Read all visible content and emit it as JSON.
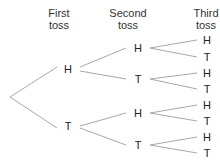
{
  "headers": [
    {
      "line1": "First",
      "line2": "toss",
      "cx": 59
    },
    {
      "line1": "Second",
      "line2": "toss",
      "cx": 128
    },
    {
      "line1": "Third",
      "line2": "toss",
      "cx": 206
    }
  ],
  "root": {
    "x": 10,
    "y": 97
  },
  "nodes": [
    {
      "id": "1H",
      "label": "H",
      "x": 68,
      "y": 69
    },
    {
      "id": "1T",
      "label": "T",
      "x": 68,
      "y": 126
    },
    {
      "id": "2HH",
      "label": "H",
      "x": 138,
      "y": 48
    },
    {
      "id": "2HT",
      "label": "T",
      "x": 138,
      "y": 79
    },
    {
      "id": "2TH",
      "label": "H",
      "x": 138,
      "y": 113
    },
    {
      "id": "2TT",
      "label": "T",
      "x": 138,
      "y": 145
    },
    {
      "id": "3HHH",
      "label": "H",
      "x": 207,
      "y": 40
    },
    {
      "id": "3HHT",
      "label": "T",
      "x": 207,
      "y": 57
    },
    {
      "id": "3HTH",
      "label": "H",
      "x": 207,
      "y": 73
    },
    {
      "id": "3HTT",
      "label": "T",
      "x": 207,
      "y": 89
    },
    {
      "id": "3THH",
      "label": "H",
      "x": 207,
      "y": 105
    },
    {
      "id": "3THT",
      "label": "T",
      "x": 207,
      "y": 121
    },
    {
      "id": "3TTH",
      "label": "H",
      "x": 207,
      "y": 137
    },
    {
      "id": "3TTT",
      "label": "T",
      "x": 207,
      "y": 153
    }
  ],
  "edges": [
    [
      10,
      97,
      57,
      67
    ],
    [
      10,
      97,
      57,
      128
    ],
    [
      80,
      67,
      126,
      48
    ],
    [
      80,
      71,
      126,
      79
    ],
    [
      80,
      126,
      126,
      113
    ],
    [
      80,
      128,
      126,
      145
    ],
    [
      150,
      48,
      197,
      40
    ],
    [
      150,
      48,
      197,
      57
    ],
    [
      150,
      79,
      197,
      73
    ],
    [
      150,
      79,
      197,
      89
    ],
    [
      150,
      113,
      197,
      105
    ],
    [
      150,
      113,
      197,
      121
    ],
    [
      150,
      145,
      197,
      137
    ],
    [
      150,
      145,
      197,
      153
    ]
  ],
  "colors": {
    "line": "#a8a8a8",
    "text": "#222222"
  }
}
